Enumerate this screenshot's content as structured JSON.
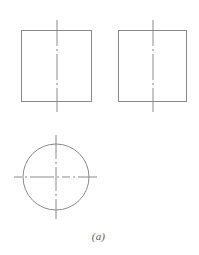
{
  "figure": {
    "caption": "(a)",
    "background_color": "#ffffff",
    "line_color": "#8a8a8a",
    "centerline_color": "#8a8a8a",
    "width": 199,
    "height": 255
  },
  "chart_data": {
    "type": "diagram",
    "title": "(a)",
    "subtitle": "",
    "xlabel": "",
    "ylabel": "",
    "grid": false,
    "legend": false,
    "units": "px",
    "views": [
      {
        "name": "front-view",
        "shape": "rectangle",
        "x": 21,
        "y": 30,
        "width": 71,
        "height": 72,
        "centerlines": [
          {
            "orientation": "vertical",
            "x": 57,
            "y1": 20,
            "y2": 112
          }
        ]
      },
      {
        "name": "side-view",
        "shape": "rectangle",
        "x": 118,
        "y": 30,
        "width": 69,
        "height": 72,
        "centerlines": [
          {
            "orientation": "vertical",
            "x": 153,
            "y1": 20,
            "y2": 112
          }
        ]
      },
      {
        "name": "top-view",
        "shape": "circle",
        "cx": 56,
        "cy": 177,
        "r": 33,
        "centerlines": [
          {
            "orientation": "vertical",
            "x": 56,
            "y1": 135,
            "y2": 219
          },
          {
            "orientation": "horizontal",
            "y": 177,
            "x1": 14,
            "x2": 97
          }
        ]
      }
    ],
    "annotations": [
      {
        "text": "(a)",
        "x": 98,
        "y": 238,
        "style": "italic-serif"
      }
    ]
  }
}
